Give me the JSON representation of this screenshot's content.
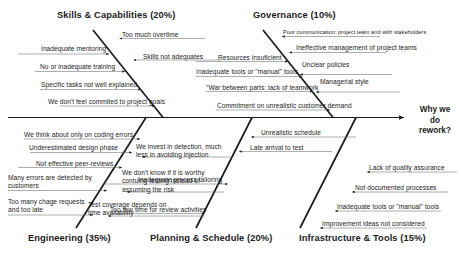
{
  "diagram": {
    "type": "fishbone-ishikawa",
    "effect": {
      "label": "Why we do rework?",
      "line1": "Why we",
      "line2": "do",
      "line3": "rework?"
    },
    "categories": [
      {
        "id": "skills",
        "title": "Skills & Capabilities (20%)",
        "name": "Skills & Capabilities",
        "percent": "20%",
        "side": "top",
        "causes": [
          {
            "text": "Too much overtime"
          },
          {
            "text": "Inadequate mentoring"
          },
          {
            "text": "Skills not adequates"
          },
          {
            "text": "No or inadequate training"
          },
          {
            "text": "Specific tasks not well explained"
          },
          {
            "text": "We don't feel commited to project goals"
          }
        ]
      },
      {
        "id": "governance",
        "title": "Governance (10%)",
        "name": "Governance",
        "percent": "10%",
        "side": "top",
        "causes": [
          {
            "text": "Poor communication:  project team and with stakeholders"
          },
          {
            "text": "Ineffective management of project teams"
          },
          {
            "text": "Resources insuficient"
          },
          {
            "text": "Unclear policies"
          },
          {
            "text": "Inadequate tools or \"manual\" tools"
          },
          {
            "text": "Managerial style"
          },
          {
            "text": "\"War between parts: lack of teamwork"
          },
          {
            "text": "Commitment on unrealistic customer demand"
          }
        ]
      },
      {
        "id": "engineering",
        "title": "Engineering (35%)",
        "name": "Engineering",
        "percent": "35%",
        "side": "bottom",
        "causes": [
          {
            "text": "We think about only on coding errors"
          },
          {
            "text": "Underestimated  design phase"
          },
          {
            "text": "We invest in detection, much less in avoiding injection"
          },
          {
            "text": "Not effective peer-reviews"
          },
          {
            "text": "We don't know if it is worthy contuing testing instead of assuming the risk"
          },
          {
            "text": "Many errors are detected by customers"
          },
          {
            "text": "Too many chage requests and too late"
          },
          {
            "text": "Test coverage depends on time availability"
          }
        ]
      },
      {
        "id": "planning",
        "title": "Planning & Schedule (20%)",
        "name": "Planning & Schedule",
        "percent": "20%",
        "side": "bottom",
        "causes": [
          {
            "text": "Unrealistic schedule"
          },
          {
            "text": "Late arrival to test"
          },
          {
            "text": "Inadequate process tailoring"
          },
          {
            "text": "Too few time for review activities"
          }
        ]
      },
      {
        "id": "infrastructure",
        "title": "Infrastructure & Tools (15%)",
        "name": "Infrastructure & Tools",
        "percent": "15%",
        "side": "bottom",
        "causes": [
          {
            "text": "Lack of quality assurance"
          },
          {
            "text": "Not documented processes"
          },
          {
            "text": "Inadequate tools or \"manual\" tools"
          },
          {
            "text": "Improvement ideas not considered"
          }
        ]
      }
    ],
    "colors": {
      "line": "#1b1b1b",
      "text": "#1b1b1b",
      "background": "#ffffff"
    }
  }
}
